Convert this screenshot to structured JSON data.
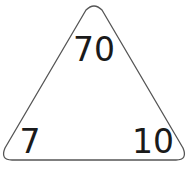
{
  "diagram": {
    "type": "fact-family-triangle",
    "top": "70",
    "bottom_left": "7",
    "bottom_right": "10",
    "outline_color": "#555555",
    "text_color": "#1a1a1a"
  }
}
